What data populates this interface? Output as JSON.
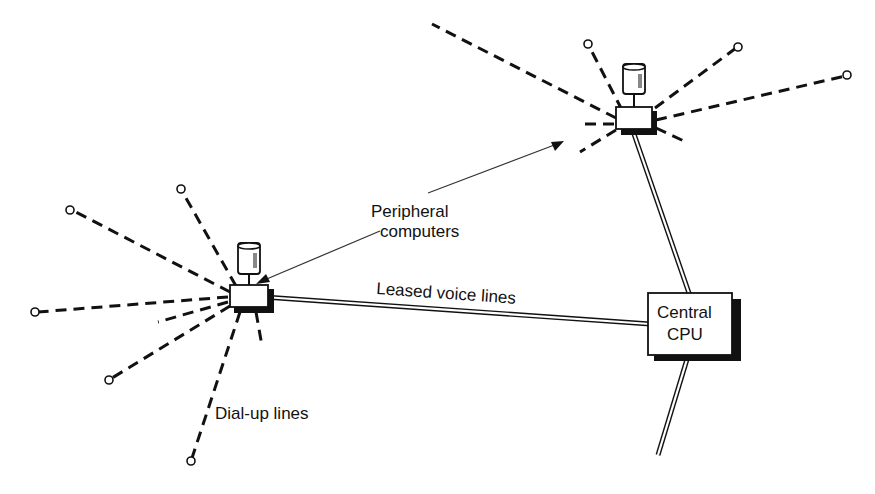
{
  "diagram": {
    "labels": {
      "peripheral": [
        "Peripheral",
        "computers"
      ],
      "leased": "Leased voice lines",
      "dialup": "Dial-up lines",
      "central": [
        "Central",
        "CPU"
      ]
    },
    "nodes": [
      {
        "id": "peripheral-left",
        "type": "peripheral-computer",
        "x": 244,
        "y": 297
      },
      {
        "id": "peripheral-right",
        "type": "peripheral-computer",
        "x": 634,
        "y": 118
      },
      {
        "id": "central-cpu",
        "type": "central-cpu",
        "x": 685,
        "y": 326
      }
    ],
    "edges": [
      {
        "from": "peripheral-left",
        "to": "central-cpu",
        "style": "double",
        "label": "Leased voice lines"
      },
      {
        "from": "peripheral-right",
        "to": "central-cpu",
        "style": "double"
      },
      {
        "from": "central-cpu",
        "to": "offscreen-bottom",
        "style": "double"
      }
    ],
    "colors": {
      "line": "#111111",
      "background": "#ffffff"
    }
  }
}
